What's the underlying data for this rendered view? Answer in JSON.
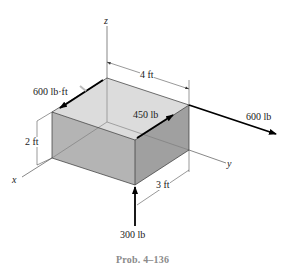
{
  "figure": {
    "caption": "Prob. 4–136",
    "axes": {
      "x": "x",
      "y": "y",
      "z": "z"
    },
    "dimensions": {
      "length": "4 ft",
      "width": "3 ft",
      "height": "2 ft"
    },
    "loads": {
      "couple_moment": "600 lb·ft",
      "force_top_right": "600 lb",
      "force_top_middle": "450 lb",
      "force_bottom": "300 lb"
    },
    "colors": {
      "top_face": "#dcdcdc",
      "front_face": "#b4b4b4",
      "right_face": "#a0a0a0",
      "arrow": "#000000",
      "caption": "#8a8a8a"
    }
  }
}
